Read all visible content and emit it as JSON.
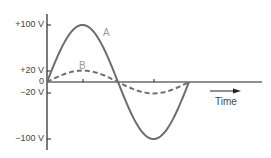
{
  "chart_data": {
    "type": "line",
    "title": "",
    "xlabel": "Time",
    "ylabel": "",
    "y_ticks": [
      "+100 V",
      "+20 V",
      "0",
      "−20 V",
      "−100 V"
    ],
    "y_tick_values": [
      100,
      20,
      0,
      -20,
      -100
    ],
    "ylim": [
      -100,
      100
    ],
    "grid": false,
    "legend": "inline",
    "series": [
      {
        "name": "A",
        "style": "solid",
        "amplitude": 100,
        "cycles": 1
      },
      {
        "name": "B",
        "style": "dashed",
        "amplitude": 20,
        "cycles": 1
      }
    ],
    "colors": {
      "A": "#6e6e6e",
      "B": "#6e6e6e",
      "axis": "#222222",
      "labels": "#444444",
      "curve_labels": "#9a9a9a"
    }
  },
  "labels": {
    "y_plus100": "+100 V",
    "y_plus20": "+20 V",
    "y_zero": "0",
    "y_minus20": "−20 V",
    "y_minus100": "−100 V",
    "curve_a": "A",
    "curve_b": "B",
    "time": "Time"
  }
}
